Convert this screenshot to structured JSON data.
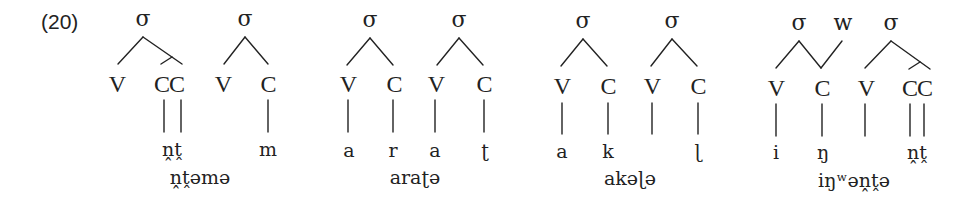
{
  "example_number": "(20)",
  "diagrams": [
    {
      "word": "ṋṱəmə",
      "syllables": [
        {
          "label": "σ",
          "nodes": [
            "V",
            "CC"
          ]
        },
        {
          "label": "σ",
          "nodes": [
            "V",
            "C"
          ]
        }
      ],
      "segments": [
        "ṋṱ",
        "m"
      ]
    },
    {
      "word": "araʈə",
      "syllables": [
        {
          "label": "σ",
          "nodes": [
            "V",
            "C"
          ]
        },
        {
          "label": "σ",
          "nodes": [
            "V",
            "C"
          ]
        }
      ],
      "segments": [
        "a",
        "r",
        "a",
        "ʈ"
      ]
    },
    {
      "word": "akəɭə",
      "syllables": [
        {
          "label": "σ",
          "nodes": [
            "V",
            "C"
          ]
        },
        {
          "label": "σ",
          "nodes": [
            "V",
            "C"
          ]
        }
      ],
      "segments": [
        "a",
        "k",
        "ɭ"
      ]
    },
    {
      "word": "iŋʷəṋṱə",
      "syllables": [
        {
          "label": "σ",
          "nodes": [
            "V",
            "C"
          ]
        },
        {
          "label": "σ",
          "nodes": [
            "V",
            "CC"
          ]
        }
      ],
      "extra_node": "w",
      "segments": [
        "i",
        "ŋ",
        "ṋṱ"
      ]
    }
  ],
  "colors": {
    "ink": "#222222",
    "background": "#ffffff"
  }
}
